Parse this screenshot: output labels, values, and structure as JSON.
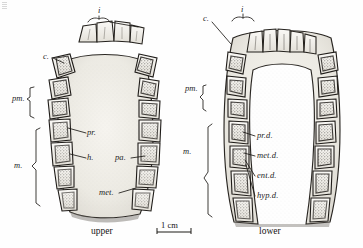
{
  "figure": {
    "medium": "ink-stipple-line-drawing",
    "background_color": "#fefefe",
    "ink_color": "#1c1c1c",
    "enamel_fill": "#f2f0ec",
    "palate_fill": "#eceae4",
    "shadow_color": "#6e6a64"
  },
  "captions": {
    "upper": "upper",
    "lower": "lower"
  },
  "scale_bar": {
    "label": "1 cm",
    "length_px": 34
  },
  "upper_jaw": {
    "name": "upper-jaw-occlusal",
    "labels": [
      {
        "key": "i",
        "text": "i",
        "x": 98,
        "y": 13,
        "kind": "bracket-top"
      },
      {
        "key": "c",
        "text": "c.",
        "x": 45,
        "y": 57,
        "kind": "leader"
      },
      {
        "key": "pm",
        "text": "pm.",
        "x": 16,
        "y": 98,
        "kind": "bracket-left"
      },
      {
        "key": "m",
        "text": "m.",
        "x": 16,
        "y": 167,
        "kind": "bracket-left"
      },
      {
        "key": "pr",
        "text": "pr.",
        "x": 88,
        "y": 131,
        "kind": "leader"
      },
      {
        "key": "h",
        "text": "h.",
        "x": 88,
        "y": 156,
        "kind": "leader"
      },
      {
        "key": "pa",
        "text": "pa.",
        "x": 116,
        "y": 157,
        "kind": "leader"
      },
      {
        "key": "met",
        "text": "met.",
        "x": 101,
        "y": 193,
        "kind": "leader"
      }
    ]
  },
  "lower_jaw": {
    "name": "lower-jaw-occlusal",
    "labels": [
      {
        "key": "i",
        "text": "i",
        "x": 240,
        "y": 11,
        "kind": "bracket-top"
      },
      {
        "key": "c",
        "text": "c.",
        "x": 204,
        "y": 19,
        "kind": "leader"
      },
      {
        "key": "pm",
        "text": "pm.",
        "x": 189,
        "y": 88,
        "kind": "bracket-left"
      },
      {
        "key": "m",
        "text": "m.",
        "x": 185,
        "y": 153,
        "kind": "bracket-left"
      },
      {
        "key": "pr_d",
        "text": "pr.d.",
        "x": 257,
        "y": 135,
        "kind": "leader"
      },
      {
        "key": "met_d",
        "text": "met.d.",
        "x": 257,
        "y": 155,
        "kind": "leader"
      },
      {
        "key": "ent_d",
        "text": "ent.d.",
        "x": 257,
        "y": 175,
        "kind": "leader"
      },
      {
        "key": "hyp_d",
        "text": "hyp.d.",
        "x": 257,
        "y": 195,
        "kind": "leader"
      }
    ]
  }
}
